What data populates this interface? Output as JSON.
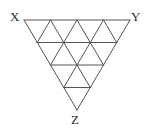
{
  "figure": {
    "background_color": "#ffffff",
    "line_color": "#555555",
    "label_color": "#2b2b2b",
    "line_width": 1,
    "width": 147,
    "height": 132
  },
  "labels": {
    "x": "X",
    "y": "Y",
    "z": "Z"
  },
  "geometry": {
    "orientation": "apex-down",
    "rows": 4,
    "small_triangle_count": 16,
    "vertices": {
      "X": {
        "x": 24,
        "y": 20
      },
      "Y": {
        "x": 130,
        "y": 20
      },
      "Z": {
        "x": 77,
        "y": 110
      }
    },
    "edges": {
      "top": "X-Y",
      "left": "X-Z",
      "right": "Y-Z"
    },
    "lattice_rows": [
      {
        "row": 1,
        "y": 20,
        "span_left": 24,
        "span_right": 130,
        "nodes": 5
      },
      {
        "row": 2,
        "y": 42,
        "span_left": 37,
        "span_right": 117,
        "nodes": 4
      },
      {
        "row": 3,
        "y": 65,
        "span_left": 50,
        "span_right": 104,
        "nodes": 3
      },
      {
        "row": 4,
        "y": 87,
        "span_left": 64,
        "span_right": 91,
        "nodes": 2
      },
      {
        "row": 5,
        "y": 110,
        "span_left": 77,
        "span_right": 77,
        "nodes": 1
      }
    ]
  }
}
